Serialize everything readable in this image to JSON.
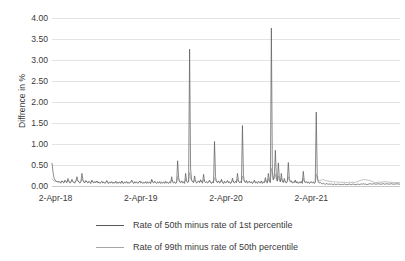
{
  "chart_data": {
    "type": "line",
    "title": "",
    "xlabel": "",
    "ylabel": "Diffrence in %",
    "ylim": [
      0,
      4
    ],
    "ytick_labels": [
      "4.00",
      "3.50",
      "3.00",
      "2.50",
      "2.00",
      "1.50",
      "1.00",
      "0.50",
      "0.00"
    ],
    "ytick_values": [
      4.0,
      3.5,
      3.0,
      2.5,
      2.0,
      1.5,
      1.0,
      0.5,
      0.0
    ],
    "xtick_labels": [
      "2-Apr-18",
      "2-Apr-19",
      "2-Apr-20",
      "2-Apr-21"
    ],
    "xtick_positions": [
      0.01,
      0.255,
      0.5,
      0.745
    ],
    "grid": true,
    "legend_position": "bottom",
    "colors": {
      "series_1": "#595959",
      "series_2": "#a6a6a6",
      "gridline": "#e3e3e3",
      "axis": "#c9c9c9",
      "text": "#3a3a3a",
      "background": "#ffffff"
    },
    "series": [
      {
        "name": "Rate of 50th minus rate of 1st percentile",
        "color": "#595959",
        "notable_peaks": [
          {
            "x": 0.003,
            "y": 0.55
          },
          {
            "x": 0.075,
            "y": 0.3
          },
          {
            "x": 0.215,
            "y": 0.6
          },
          {
            "x": 0.243,
            "y": 3.26
          },
          {
            "x": 0.315,
            "y": 1.06
          },
          {
            "x": 0.385,
            "y": 1.44
          },
          {
            "x": 0.455,
            "y": 3.76
          },
          {
            "x": 0.478,
            "y": 0.85
          },
          {
            "x": 0.525,
            "y": 0.56
          },
          {
            "x": 0.585,
            "y": 1.76
          }
        ],
        "baseline_level": 0.06,
        "values": [
          0.55,
          0.33,
          0.2,
          0.14,
          0.12,
          0.1,
          0.09,
          0.11,
          0.08,
          0.07,
          0.12,
          0.09,
          0.07,
          0.14,
          0.1,
          0.08,
          0.18,
          0.11,
          0.07,
          0.09,
          0.16,
          0.1,
          0.08,
          0.07,
          0.12,
          0.22,
          0.13,
          0.09,
          0.07,
          0.1,
          0.3,
          0.15,
          0.09,
          0.08,
          0.13,
          0.09,
          0.07,
          0.11,
          0.08,
          0.06,
          0.14,
          0.09,
          0.07,
          0.1,
          0.08,
          0.12,
          0.07,
          0.09,
          0.06,
          0.08,
          0.11,
          0.07,
          0.09,
          0.06,
          0.08,
          0.13,
          0.07,
          0.06,
          0.09,
          0.07,
          0.1,
          0.06,
          0.08,
          0.07,
          0.11,
          0.06,
          0.08,
          0.07,
          0.09,
          0.06,
          0.12,
          0.07,
          0.06,
          0.09,
          0.07,
          0.1,
          0.06,
          0.08,
          0.07,
          0.09,
          0.14,
          0.08,
          0.06,
          0.1,
          0.07,
          0.09,
          0.06,
          0.08,
          0.12,
          0.07,
          0.09,
          0.06,
          0.08,
          0.07,
          0.1,
          0.06,
          0.09,
          0.07,
          0.08,
          0.06,
          0.16,
          0.09,
          0.07,
          0.11,
          0.08,
          0.06,
          0.09,
          0.07,
          0.1,
          0.06,
          0.08,
          0.07,
          0.09,
          0.06,
          0.11,
          0.07,
          0.08,
          0.06,
          0.09,
          0.07,
          0.22,
          0.1,
          0.07,
          0.09,
          0.06,
          0.08,
          0.6,
          0.2,
          0.1,
          0.08,
          0.12,
          0.07,
          0.09,
          0.06,
          0.3,
          0.12,
          0.08,
          0.1,
          3.26,
          0.4,
          0.15,
          0.1,
          0.08,
          0.24,
          0.11,
          0.07,
          0.09,
          0.12,
          0.08,
          0.15,
          0.09,
          0.07,
          0.28,
          0.11,
          0.08,
          0.1,
          0.07,
          0.09,
          0.14,
          0.08,
          0.06,
          0.1,
          0.07,
          1.06,
          0.22,
          0.1,
          0.08,
          0.12,
          0.07,
          0.09,
          0.16,
          0.08,
          0.06,
          0.11,
          0.07,
          0.09,
          0.13,
          0.07,
          0.1,
          0.06,
          0.08,
          0.19,
          0.09,
          0.07,
          0.11,
          0.08,
          0.3,
          0.12,
          0.08,
          0.1,
          0.07,
          1.44,
          0.25,
          0.11,
          0.08,
          0.13,
          0.07,
          0.09,
          0.11,
          0.07,
          0.1,
          0.06,
          0.08,
          0.14,
          0.07,
          0.09,
          0.06,
          0.11,
          0.08,
          0.07,
          0.12,
          0.06,
          0.09,
          0.08,
          0.2,
          0.1,
          0.07,
          0.3,
          0.12,
          0.08,
          3.76,
          0.35,
          0.15,
          0.25,
          0.85,
          0.22,
          0.12,
          0.55,
          0.18,
          0.1,
          0.3,
          0.12,
          0.08,
          0.18,
          0.09,
          0.07,
          0.11,
          0.56,
          0.18,
          0.1,
          0.12,
          0.07,
          0.09,
          0.08,
          0.14,
          0.07,
          0.1,
          0.06,
          0.09,
          0.07,
          0.11,
          0.06,
          0.35,
          0.12,
          0.08,
          0.1,
          0.07,
          0.09,
          0.06,
          0.08,
          0.1,
          0.07,
          0.09,
          0.06,
          0.08,
          1.76,
          0.25,
          0.1,
          0.07,
          0.09,
          0.06,
          0.05,
          0.07,
          0.05,
          0.04,
          0.06,
          0.05,
          0.04,
          0.05,
          0.04,
          0.05,
          0.04,
          0.03,
          0.05,
          0.04,
          0.03,
          0.04,
          0.05,
          0.03,
          0.04,
          0.03,
          0.04,
          0.03,
          0.05,
          0.04,
          0.03,
          0.04,
          0.03,
          0.05,
          0.04,
          0.03,
          0.04,
          0.05,
          0.03,
          0.04,
          0.03,
          0.04,
          0.05,
          0.03,
          0.04,
          0.05,
          0.04,
          0.06,
          0.04,
          0.05,
          0.04,
          0.03,
          0.05,
          0.04,
          0.06,
          0.05,
          0.04,
          0.05,
          0.06,
          0.04,
          0.05,
          0.04,
          0.06,
          0.05,
          0.04,
          0.05,
          0.04,
          0.06,
          0.05,
          0.04,
          0.05,
          0.06,
          0.04,
          0.05,
          0.04,
          0.06,
          0.05,
          0.04,
          0.05,
          0.04,
          0.05,
          0.06,
          0.04,
          0.05,
          0.04
        ]
      },
      {
        "name": "Rate of 99th minus rate of 50th percentile",
        "color": "#a6a6a6",
        "baseline_level": 0.1,
        "values": [
          0.18,
          0.14,
          0.12,
          0.11,
          0.1,
          0.12,
          0.09,
          0.11,
          0.1,
          0.09,
          0.13,
          0.1,
          0.09,
          0.12,
          0.11,
          0.09,
          0.14,
          0.1,
          0.09,
          0.11,
          0.13,
          0.1,
          0.09,
          0.1,
          0.12,
          0.15,
          0.11,
          0.1,
          0.09,
          0.11,
          0.16,
          0.12,
          0.1,
          0.09,
          0.12,
          0.1,
          0.09,
          0.11,
          0.1,
          0.08,
          0.12,
          0.1,
          0.09,
          0.11,
          0.09,
          0.12,
          0.09,
          0.1,
          0.08,
          0.09,
          0.11,
          0.09,
          0.1,
          0.08,
          0.09,
          0.12,
          0.09,
          0.08,
          0.1,
          0.09,
          0.11,
          0.08,
          0.09,
          0.08,
          0.11,
          0.08,
          0.09,
          0.08,
          0.1,
          0.08,
          0.12,
          0.09,
          0.08,
          0.1,
          0.09,
          0.11,
          0.08,
          0.09,
          0.08,
          0.1,
          0.13,
          0.09,
          0.08,
          0.1,
          0.09,
          0.1,
          0.08,
          0.09,
          0.12,
          0.09,
          0.1,
          0.08,
          0.09,
          0.08,
          0.11,
          0.08,
          0.1,
          0.09,
          0.09,
          0.08,
          0.14,
          0.1,
          0.09,
          0.11,
          0.09,
          0.08,
          0.1,
          0.09,
          0.11,
          0.08,
          0.09,
          0.08,
          0.1,
          0.08,
          0.11,
          0.09,
          0.09,
          0.08,
          0.1,
          0.09,
          0.15,
          0.11,
          0.09,
          0.1,
          0.08,
          0.09,
          0.22,
          0.13,
          0.1,
          0.09,
          0.12,
          0.09,
          0.1,
          0.08,
          0.16,
          0.11,
          0.09,
          0.11,
          0.32,
          0.18,
          0.12,
          0.1,
          0.09,
          0.14,
          0.11,
          0.09,
          0.1,
          0.12,
          0.09,
          0.13,
          0.1,
          0.09,
          0.15,
          0.11,
          0.09,
          0.1,
          0.09,
          0.1,
          0.12,
          0.09,
          0.08,
          0.1,
          0.09,
          0.2,
          0.13,
          0.1,
          0.09,
          0.12,
          0.09,
          0.1,
          0.14,
          0.09,
          0.08,
          0.11,
          0.09,
          0.1,
          0.12,
          0.09,
          0.1,
          0.08,
          0.09,
          0.13,
          0.1,
          0.09,
          0.11,
          0.09,
          0.16,
          0.11,
          0.09,
          0.1,
          0.09,
          0.24,
          0.14,
          0.11,
          0.09,
          0.12,
          0.09,
          0.1,
          0.11,
          0.09,
          0.1,
          0.08,
          0.09,
          0.12,
          0.09,
          0.1,
          0.08,
          0.11,
          0.09,
          0.09,
          0.12,
          0.08,
          0.1,
          0.09,
          0.14,
          0.1,
          0.09,
          0.17,
          0.11,
          0.09,
          0.42,
          0.22,
          0.14,
          0.18,
          0.28,
          0.15,
          0.11,
          0.24,
          0.13,
          0.1,
          0.18,
          0.11,
          0.09,
          0.13,
          0.1,
          0.09,
          0.11,
          0.22,
          0.13,
          0.1,
          0.12,
          0.09,
          0.1,
          0.09,
          0.13,
          0.09,
          0.1,
          0.08,
          0.1,
          0.09,
          0.11,
          0.09,
          0.18,
          0.11,
          0.09,
          0.1,
          0.09,
          0.1,
          0.08,
          0.09,
          0.1,
          0.09,
          0.1,
          0.08,
          0.09,
          0.28,
          0.17,
          0.13,
          0.12,
          0.13,
          0.14,
          0.15,
          0.15,
          0.14,
          0.13,
          0.13,
          0.12,
          0.12,
          0.11,
          0.11,
          0.11,
          0.1,
          0.1,
          0.1,
          0.1,
          0.09,
          0.09,
          0.1,
          0.09,
          0.09,
          0.09,
          0.09,
          0.08,
          0.09,
          0.09,
          0.08,
          0.09,
          0.08,
          0.09,
          0.09,
          0.08,
          0.09,
          0.09,
          0.08,
          0.09,
          0.09,
          0.1,
          0.11,
          0.12,
          0.13,
          0.14,
          0.14,
          0.15,
          0.15,
          0.15,
          0.15,
          0.14,
          0.14,
          0.13,
          0.13,
          0.12,
          0.11,
          0.1,
          0.09,
          0.08,
          0.08,
          0.08,
          0.09,
          0.09,
          0.09,
          0.09,
          0.09,
          0.1,
          0.1,
          0.1,
          0.1,
          0.1,
          0.09,
          0.09,
          0.09,
          0.09,
          0.09,
          0.08,
          0.08,
          0.08,
          0.08,
          0.08,
          0.08,
          0.08,
          0.08
        ]
      }
    ]
  },
  "legend": {
    "items": [
      {
        "label": "Rate of 50th minus rate of 1st percentile"
      },
      {
        "label": "Rate of 99th minus rate of 50th percentile"
      }
    ]
  }
}
